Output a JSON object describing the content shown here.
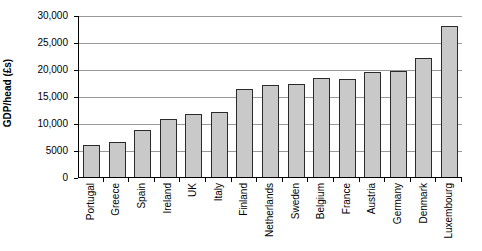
{
  "chart_data": {
    "type": "bar",
    "title": "",
    "xlabel": "",
    "ylabel": "GDP/head (£s)",
    "ylim": [
      0,
      30000
    ],
    "ytick_values": [
      0,
      5000,
      10000,
      15000,
      20000,
      25000,
      30000
    ],
    "ytick_labels": [
      "0",
      "5000",
      "10,000",
      "15,000",
      "20,000",
      "25,000",
      "30,000"
    ],
    "grid": true,
    "legend": "none",
    "bar_color": "#c9c9c9",
    "bar_border_color": "#2b2b2b",
    "gridline_color": "#999999",
    "axis_color": "#000000",
    "categories": [
      "Portugal",
      "Greece",
      "Spain",
      "Ireland",
      "UK",
      "Italy",
      "Finland",
      "Netherlands",
      "Sweden",
      "Belgium",
      "France",
      "Austria",
      "Germany",
      "Denmark",
      "Luxembourg"
    ],
    "values": [
      6100,
      6600,
      8900,
      10900,
      11900,
      12200,
      16500,
      17200,
      17400,
      18500,
      18400,
      19600,
      19800,
      22200,
      28200
    ]
  }
}
